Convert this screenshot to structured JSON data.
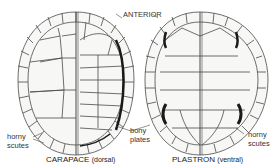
{
  "diagram": {
    "title_label": "ANTERIOR",
    "carapace": {
      "caption": "CARAPACE",
      "caption_sub": "(dorsal)"
    },
    "plastron": {
      "caption": "PLASTRON",
      "caption_sub": "(ventral)"
    },
    "labels": {
      "left_horny_1": "horny",
      "left_horny_2": "scutes",
      "bony_1": "bony",
      "bony_2": "plates",
      "right_horny_1": "horny",
      "right_horny_2": "scutes"
    },
    "colors": {
      "line": "#4a4a4a",
      "fill": "#f7f7f5",
      "dark": "#1a1a1a"
    }
  }
}
